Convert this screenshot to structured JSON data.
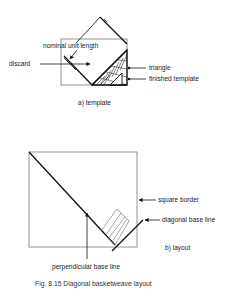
{
  "figure": {
    "caption": "Fig. 8.15  Diagonal basketweave layout",
    "part_a": {
      "sublabel": "a) template",
      "labels": {
        "nominal_unit_length": "nominal unit length",
        "discard": "discard",
        "triangle": "triangle",
        "finished_template": "finished template"
      }
    },
    "part_b": {
      "sublabel": "b) layout",
      "labels": {
        "square_border": "square border",
        "diagonal_base_line": "diagonal base line",
        "perpendicular_base_line": "perpendicular base line"
      }
    }
  },
  "colors": {
    "line": "#111111",
    "thin_line": "#666666",
    "text": "#222222",
    "background": "#ffffff"
  }
}
